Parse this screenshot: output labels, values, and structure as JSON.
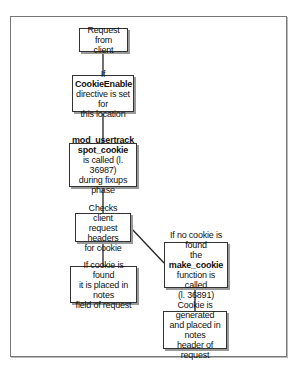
{
  "diagram": {
    "nodes": [
      {
        "id": "request",
        "lines": [
          {
            "t": "Request from"
          },
          {
            "t": "client"
          }
        ]
      },
      {
        "id": "cookieenable",
        "lines": [
          {
            "pre": "If ",
            "bold": "CookieEnable"
          },
          {
            "t": "directive is set for"
          },
          {
            "t": "this location"
          }
        ]
      },
      {
        "id": "spot",
        "lines": [
          {
            "bold": "mod_usertrack"
          },
          {
            "bold": "spot_cookie"
          },
          {
            "t": "is called (l. 36987)"
          },
          {
            "t": "during fixups phase"
          }
        ]
      },
      {
        "id": "checks",
        "lines": [
          {
            "t": "Checks client"
          },
          {
            "t": "request headers"
          },
          {
            "t": "for cookie"
          }
        ]
      },
      {
        "id": "found",
        "lines": [
          {
            "t": "If cookie is found"
          },
          {
            "t": "it is placed in notes"
          },
          {
            "t": "field of request"
          }
        ]
      },
      {
        "id": "notfound",
        "lines": [
          {
            "t": "If no cookie is found"
          },
          {
            "pre": "the ",
            "bold": "make_cookie"
          },
          {
            "t": "function is called"
          },
          {
            "t": "(l. 36891)"
          }
        ]
      },
      {
        "id": "generated",
        "lines": [
          {
            "t": "Cookie is generated"
          },
          {
            "t": "and placed in notes"
          },
          {
            "t": "header of request"
          }
        ]
      }
    ],
    "edges": [
      [
        "request",
        "cookieenable"
      ],
      [
        "cookieenable",
        "spot"
      ],
      [
        "spot",
        "checks"
      ],
      [
        "checks",
        "found"
      ],
      [
        "checks",
        "notfound"
      ],
      [
        "notfound",
        "generated"
      ]
    ]
  }
}
